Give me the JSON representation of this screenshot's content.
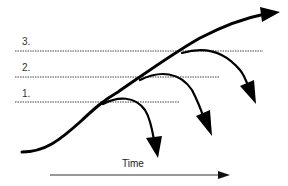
{
  "diagram": {
    "levels": [
      {
        "label": "3.",
        "y": 51,
        "x_end": 263
      },
      {
        "label": "2.",
        "y": 77,
        "x_end": 219
      },
      {
        "label": "1.",
        "y": 102,
        "x_end": 180
      }
    ],
    "axis": {
      "label": "Time"
    },
    "colors": {
      "stroke": "#000000",
      "dotted": "#444444",
      "axis": "#333333",
      "background": "#ffffff"
    }
  }
}
